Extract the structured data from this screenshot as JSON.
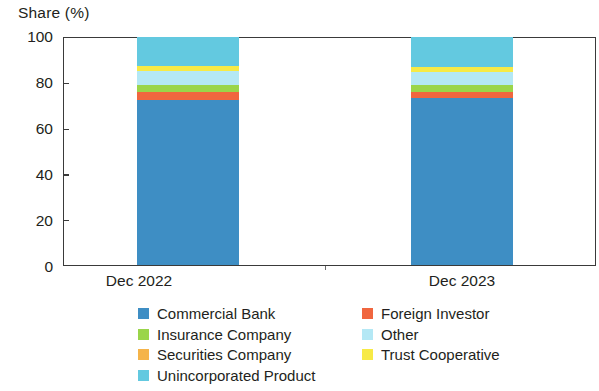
{
  "chart_data": {
    "type": "bar",
    "title": "",
    "ylabel": "Share (%)",
    "xlabel": "",
    "ylim": [
      0,
      100
    ],
    "yticks": [
      0,
      20,
      40,
      60,
      80,
      100
    ],
    "grid": false,
    "stacked": true,
    "legend_position": "bottom",
    "categories": [
      "Dec 2022",
      "Dec 2023"
    ],
    "series": [
      {
        "name": "Commercial Bank",
        "color": "#3e8ec4",
        "values": [
          72.5,
          73.0
        ]
      },
      {
        "name": "Foreign Investor",
        "color": "#f0663f",
        "values": [
          3.3,
          2.8
        ]
      },
      {
        "name": "Insurance Company",
        "color": "#9ad54a",
        "values": [
          3.2,
          3.0
        ]
      },
      {
        "name": "Other",
        "color": "#b4e8f5",
        "values": [
          6.0,
          5.8
        ]
      },
      {
        "name": "Securities Company",
        "color": "#f5b44a",
        "values": [
          0.0,
          0.0
        ]
      },
      {
        "name": "Trust Cooperative",
        "color": "#f7ea46",
        "values": [
          2.3,
          2.4
        ]
      },
      {
        "name": "Unincorporated Product",
        "color": "#63c9e0",
        "values": [
          12.7,
          13.0
        ]
      }
    ]
  },
  "axis": {
    "y_title": "Share (%)",
    "y_tick_labels": [
      "100",
      "80",
      "60",
      "40",
      "20",
      "0"
    ],
    "x_tick_labels": [
      "Dec 2022",
      "Dec 2023"
    ]
  },
  "legend": {
    "rows": [
      {
        "left": {
          "label": "Commercial Bank",
          "color": "#3e8ec4"
        },
        "right": {
          "label": "Foreign Investor",
          "color": "#f0663f"
        }
      },
      {
        "left": {
          "label": "Insurance Company",
          "color": "#9ad54a"
        },
        "right": {
          "label": "Other",
          "color": "#b4e8f5"
        }
      },
      {
        "left": {
          "label": "Securities Company",
          "color": "#f5b44a"
        },
        "right": {
          "label": "Trust Cooperative",
          "color": "#f7ea46"
        }
      },
      {
        "left": {
          "label": "Unincorporated Product",
          "color": "#63c9e0"
        },
        "right": null
      }
    ]
  }
}
